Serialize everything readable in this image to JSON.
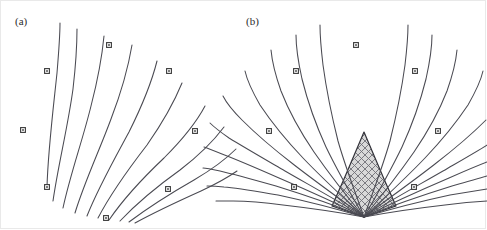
{
  "figure": {
    "background_color": "#ffffff",
    "border_color": "#e9e9e9",
    "curve_color": "#4a4a52",
    "marker_stroke_color": "#3a3a3a",
    "marker_fill_color": "#ffffff",
    "shading_color": "#a8a8a8",
    "shading_background": "#d8d8d8",
    "width": 486,
    "height": 229
  },
  "panels": [
    {
      "id": "panel-a",
      "label": "(a)",
      "label_x": 14,
      "label_y": 24,
      "description": "Fan of characteristic curves emanating from a focus point at lower left, no shaded region",
      "focus_point": {
        "x": 46,
        "y": 186
      },
      "curve_count": 10,
      "has_shaded_region": false,
      "curves": [
        {
          "id": "a-c1",
          "d": "M 46 186 C 47 150 52 110 56 72 C 58 48 59 33 59 22"
        },
        {
          "id": "a-c2",
          "d": "M 52 200 C 57 165 67 125 72 88 C 75 62 76 42 76 28"
        },
        {
          "id": "a-c3",
          "d": "M 62 207 C 69 174 82 138 90 105 C 97 78 101 56 103 35"
        },
        {
          "id": "a-c4",
          "d": "M 74 212 C 83 182 99 148 110 118 C 120 92 127 68 131 44"
        },
        {
          "id": "a-c5",
          "d": "M 86 215 C 97 187 114 157 128 131 C 140 107 150 84 156 60"
        },
        {
          "id": "a-c6",
          "d": "M 97 217 C 110 192 129 166 146 144 C 160 124 172 104 181 82"
        },
        {
          "id": "a-c7",
          "d": "M 108 219 C 123 197 144 175 163 157 C 179 141 194 124 204 105"
        },
        {
          "id": "a-c8",
          "d": "M 119 220 C 136 202 158 184 179 169 C 196 156 211 142 223 126"
        },
        {
          "id": "a-c9",
          "d": "M 128 221 C 148 206 172 191 193 179 C 210 169 224 159 235 148"
        },
        {
          "id": "a-c10",
          "d": "M 134 222 C 156 210 180 199 200 190 C 215 183 226 177 236 170"
        }
      ],
      "markers": [
        {
          "id": "a-m1",
          "x": 22,
          "y": 129,
          "shape": "square"
        },
        {
          "id": "a-m2",
          "x": 46,
          "y": 70,
          "shape": "square"
        },
        {
          "id": "a-m3",
          "x": 108,
          "y": 44,
          "shape": "square"
        },
        {
          "id": "a-m4",
          "x": 168,
          "y": 70,
          "shape": "square"
        },
        {
          "id": "a-m5",
          "x": 194,
          "y": 130,
          "shape": "square"
        },
        {
          "id": "a-m6",
          "x": 167,
          "y": 188,
          "shape": "square"
        },
        {
          "id": "a-m7",
          "x": 46,
          "y": 186,
          "shape": "square"
        },
        {
          "id": "a-m8",
          "x": 105,
          "y": 217,
          "shape": "square"
        }
      ]
    },
    {
      "id": "panel-b",
      "label": "(b)",
      "label_x": 245,
      "label_y": 24,
      "description": "Two crossing families of characteristic curves forming an X-mesh, with a cross-hatched shaded focusing region at the bottom centre",
      "focus_point": {
        "x": 363,
        "y": 216
      },
      "curve_count": 20,
      "has_shaded_region": true,
      "shaded_region": {
        "id": "b-shaded",
        "polygon": "363,131 343,178 331,205 363,216 395,205 383,178",
        "pattern": "crosshatch",
        "fill_color": "#d8d8d8"
      },
      "curves_left_family": [
        {
          "id": "b-l1",
          "d": "M 363 216 C 356 196 345 168 337 140 C 330 112 325 86 322 64 C 320 47 319 34 319 24"
        },
        {
          "id": "b-l2",
          "d": "M 363 216 C 352 197 337 171 325 146 C 314 122 306 98 301 78 C 297 60 295 46 295 34"
        },
        {
          "id": "b-l3",
          "d": "M 363 216 C 348 198 329 174 313 151 C 298 129 287 108 280 90 C 274 73 271 60 270 49"
        },
        {
          "id": "b-l4",
          "d": "M 363 216 C 345 199 322 178 302 157 C 283 137 269 119 259 104 C 251 90 246 79 244 70"
        },
        {
          "id": "b-l5",
          "d": "M 363 216 C 342 200 315 181 292 163 C 270 146 253 131 241 119 C 231 109 225 101 222 95"
        },
        {
          "id": "b-l6",
          "d": "M 363 216 C 339 201 310 185 284 170 C 260 156 241 145 228 137 C 218 130 212 125 209 122"
        },
        {
          "id": "b-l7",
          "d": "M 363 216 C 337 203 306 189 278 177 C 253 166 234 158 221 153 C 211 149 206 147 203 146"
        },
        {
          "id": "b-l8",
          "d": "M 363 216 C 336 205 304 194 275 185 C 250 178 232 173 219 170 C 210 168 205 167 202 167"
        },
        {
          "id": "b-l9",
          "d": "M 363 216 C 336 208 305 200 277 194 C 253 190 236 187 223 186 C 214 185 209 185 206 185"
        },
        {
          "id": "b-l10",
          "d": "M 363 216 C 337 211 308 207 282 204 C 260 201 244 200 232 200 C 223 200 218 200 215 200"
        }
      ],
      "curves_right_family": [
        {
          "id": "b-r1",
          "d": "M 363 216 C 370 196 381 168 389 140 C 396 112 401 86 404 64 C 406 47 407 34 407 24"
        },
        {
          "id": "b-r2",
          "d": "M 363 216 C 374 197 389 171 401 146 C 412 122 420 98 425 78 C 429 60 431 46 431 34"
        },
        {
          "id": "b-r3",
          "d": "M 363 216 C 378 198 397 174 413 151 C 428 129 439 108 446 90 C 452 73 455 60 456 49"
        },
        {
          "id": "b-r4",
          "d": "M 363 216 C 381 199 404 178 424 157 C 443 137 457 119 467 104 C 475 90 480 79 482 70"
        },
        {
          "id": "b-r5",
          "d": "M 363 216 C 384 200 411 181 434 163 C 456 146 473 131 485 119"
        },
        {
          "id": "b-r6",
          "d": "M 363 216 C 387 201 416 185 442 170 C 466 156 485 145 486 144"
        },
        {
          "id": "b-r7",
          "d": "M 363 216 C 389 203 420 189 448 177 C 473 166 486 161 486 161"
        },
        {
          "id": "b-r8",
          "d": "M 363 216 C 390 205 422 194 451 185 C 476 178 486 175 486 175"
        },
        {
          "id": "b-r9",
          "d": "M 363 216 C 390 208 421 200 449 194 C 473 190 486 188 486 188"
        },
        {
          "id": "b-r10",
          "d": "M 363 216 C 389 211 418 207 444 204 C 466 201 486 200 486 200"
        }
      ],
      "markers": [
        {
          "id": "b-m1",
          "x": 268,
          "y": 130,
          "shape": "square"
        },
        {
          "id": "b-m2",
          "x": 295,
          "y": 70,
          "shape": "square"
        },
        {
          "id": "b-m3",
          "x": 355,
          "y": 44,
          "shape": "square"
        },
        {
          "id": "b-m4",
          "x": 414,
          "y": 70,
          "shape": "square"
        },
        {
          "id": "b-m5",
          "x": 437,
          "y": 130,
          "shape": "square"
        },
        {
          "id": "b-m6",
          "x": 413,
          "y": 186,
          "shape": "square"
        },
        {
          "id": "b-m7",
          "x": 293,
          "y": 186,
          "shape": "square"
        }
      ]
    }
  ]
}
